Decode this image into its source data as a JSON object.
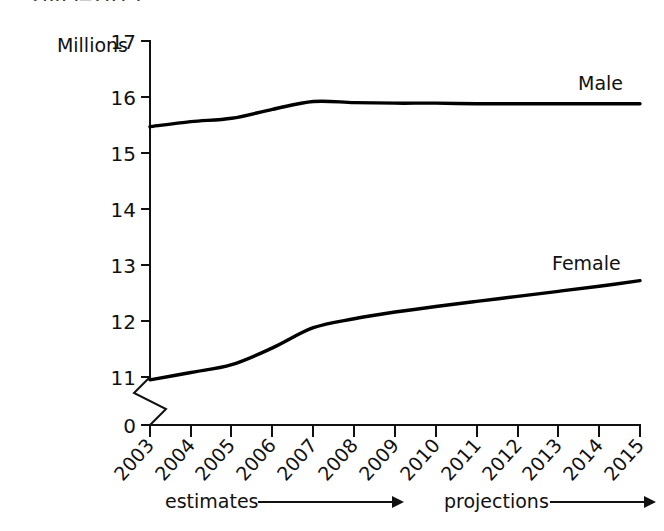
{
  "caption_fragment": "2003–2015.",
  "chart_data": {
    "type": "line",
    "title": "",
    "xlabel": "",
    "ylabel": "Millions",
    "ylim": [
      11,
      17
    ],
    "y_axis_break": true,
    "y_zero_label": "0",
    "yticks": [
      11,
      12,
      13,
      14,
      15,
      16,
      17
    ],
    "ytick_labels": [
      "11",
      "12",
      "13",
      "14",
      "15",
      "16",
      "17"
    ],
    "categories": [
      2003,
      2004,
      2005,
      2006,
      2007,
      2008,
      2009,
      2010,
      2011,
      2012,
      2013,
      2014,
      2015
    ],
    "xtick_labels": [
      "2003",
      "2004",
      "2005",
      "2006",
      "2007",
      "2008",
      "2009",
      "2010",
      "2011",
      "2012",
      "2013",
      "2014",
      "2015"
    ],
    "grid": false,
    "legend_position": "inline-right",
    "series": [
      {
        "name": "Male",
        "label": "Male",
        "values": [
          15.47,
          15.56,
          15.62,
          15.78,
          15.92,
          15.9,
          15.89,
          15.89,
          15.88,
          15.88,
          15.88,
          15.88,
          15.88
        ]
      },
      {
        "name": "Female",
        "label": "Female",
        "values": [
          10.95,
          11.08,
          11.22,
          11.52,
          11.88,
          12.04,
          12.16,
          12.26,
          12.35,
          12.44,
          12.53,
          12.62,
          12.72
        ]
      }
    ],
    "annotations": [
      {
        "text": "estimates",
        "arrow": "right"
      },
      {
        "text": "projections",
        "arrow": "right"
      }
    ]
  }
}
